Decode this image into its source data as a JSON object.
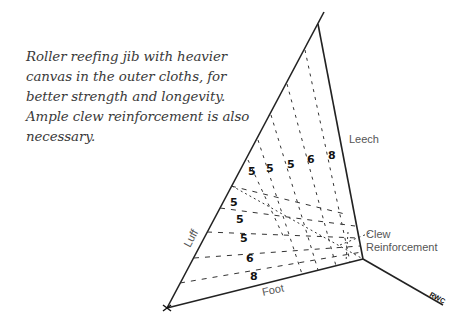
{
  "caption": "Roller reefing jib with heavier canvas in the outer cloths, for better strength and longevity. Ample clew reinforcement is also necessary.",
  "diagram": {
    "labels": {
      "luff": "Luff",
      "leech": "Leech",
      "foot": "Foot",
      "clew_line1": "Clew",
      "clew_line2": "Reinforcement",
      "signature": "RWC"
    },
    "leech_panel_weights": [
      "5",
      "5",
      "5",
      "6",
      "8"
    ],
    "foot_panel_weights": [
      "5",
      "5",
      "5",
      "6",
      "8"
    ]
  }
}
